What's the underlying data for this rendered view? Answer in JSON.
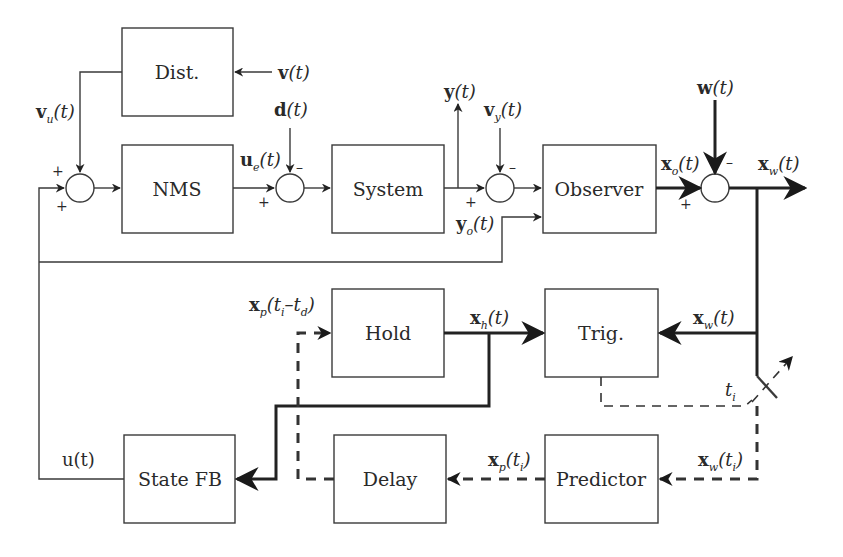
{
  "blocks": {
    "dist": "Dist.",
    "nms": "NMS",
    "system": "System",
    "observer": "Observer",
    "hold": "Hold",
    "trig": "Trig.",
    "state_fb": "State FB",
    "delay": "Delay",
    "predictor": "Predictor"
  },
  "signals": {
    "v": {
      "base": "v",
      "sub": "",
      "arg": "(t)"
    },
    "vu": {
      "base": "v",
      "sub": "u",
      "arg": "(t)"
    },
    "d": {
      "base": "d",
      "sub": "",
      "arg": "(t)"
    },
    "ue": {
      "base": "u",
      "sub": "e",
      "arg": "(t)"
    },
    "y": {
      "base": "y",
      "sub": "",
      "arg": "(t)"
    },
    "vy": {
      "base": "v",
      "sub": "y",
      "arg": "(t)"
    },
    "yo": {
      "base": "y",
      "sub": "o",
      "arg": "(t)"
    },
    "w": {
      "base": "w",
      "sub": "",
      "arg": "(t)"
    },
    "xo": {
      "base": "x",
      "sub": "o",
      "arg": "(t)"
    },
    "xw": {
      "base": "x",
      "sub": "w",
      "arg": "(t)"
    },
    "xw2": {
      "base": "x",
      "sub": "w",
      "arg": "(t)"
    },
    "xh": {
      "base": "x",
      "sub": "h",
      "arg": "(t)"
    },
    "xp_delay": {
      "base": "x",
      "sub": "p",
      "arg_pre": "(t",
      "arg_sub1": "i",
      "arg_mid": "–t",
      "arg_sub2": "d",
      "arg_post": ")"
    },
    "xp_ti": {
      "base": "x",
      "sub": "p",
      "arg_pre": "(t",
      "arg_sub1": "i",
      "arg_post": ")"
    },
    "xw_ti": {
      "base": "x",
      "sub": "w",
      "arg_pre": "(t",
      "arg_sub1": "i",
      "arg_post": ")"
    },
    "ti": {
      "base": "t",
      "sub": "i"
    },
    "u": {
      "text": "u(t)"
    }
  },
  "signs": {
    "plus": "+",
    "minus": "–"
  }
}
